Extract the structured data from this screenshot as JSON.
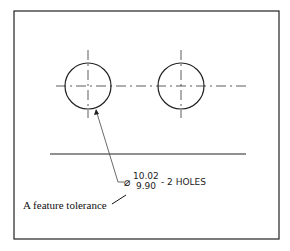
{
  "diagram": {
    "type": "engineering-drawing",
    "holes": [
      {
        "id": "hole-left",
        "cx": 88,
        "cy": 86,
        "r": 23
      },
      {
        "id": "hole-right",
        "cx": 181,
        "cy": 86,
        "r": 23
      }
    ],
    "dimension": {
      "symbol": "⌀",
      "upper_limit": "10.02",
      "lower_limit": "9.90",
      "suffix": "- 2 HOLES"
    },
    "annotation": {
      "label": "A feature tolerance"
    }
  }
}
